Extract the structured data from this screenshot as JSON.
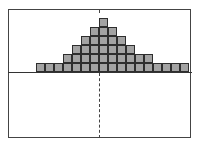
{
  "chart_data": {
    "type": "bar",
    "title": "",
    "xlabel": "",
    "ylabel": "",
    "style": "stacked unit squares (dot-plot style histogram)",
    "categories": [
      "1",
      "2",
      "3",
      "4",
      "5",
      "6",
      "7",
      "8",
      "9",
      "10",
      "11",
      "12",
      "13",
      "14",
      "15",
      "16",
      "17"
    ],
    "values": [
      1,
      1,
      1,
      2,
      3,
      4,
      5,
      6,
      5,
      4,
      3,
      2,
      2,
      1,
      1,
      1,
      1
    ],
    "ylim": [
      0,
      6
    ],
    "grid": false,
    "legend": null,
    "annotations": [
      "dashed vertical center line at column 8 (peak)",
      "horizontal baseline axis"
    ],
    "colors": {
      "fill": "#a3a3a3",
      "border": "#2e2e2e",
      "frame": "#444444"
    }
  }
}
